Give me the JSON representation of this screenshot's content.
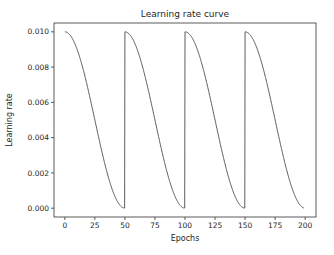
{
  "chart_data": {
    "type": "line",
    "title": "Learning rate curve",
    "xlabel": "Epochs",
    "ylabel": "Learning rate",
    "xlim": [
      -9,
      209
    ],
    "ylim": [
      -0.0005,
      0.0105
    ],
    "grid": false,
    "legend": null,
    "x_ticks": [
      0,
      25,
      50,
      75,
      100,
      125,
      150,
      175,
      200
    ],
    "x_tick_labels": [
      "0",
      "25",
      "50",
      "75",
      "100",
      "125",
      "150",
      "175",
      "200"
    ],
    "y_ticks": [
      0.0,
      0.002,
      0.004,
      0.006,
      0.008,
      0.01
    ],
    "y_tick_labels": [
      "0.000",
      "0.002",
      "0.004",
      "0.006",
      "0.008",
      "0.010"
    ],
    "series": [
      {
        "name": "learning rate",
        "color": "#333333",
        "schedule": "cosine annealing with warm restarts",
        "max_lr": 0.01,
        "min_lr": 0.0,
        "period_epochs": 50,
        "epoch_range": [
          0,
          199
        ],
        "x": [
          0,
          5,
          10,
          15,
          20,
          25,
          30,
          35,
          40,
          45,
          49,
          50,
          55,
          60,
          65,
          70,
          75,
          80,
          85,
          90,
          95,
          99,
          100,
          105,
          110,
          115,
          120,
          125,
          130,
          135,
          140,
          145,
          149,
          150,
          155,
          160,
          165,
          170,
          175,
          180,
          185,
          190,
          195,
          199
        ],
        "values": [
          0.01,
          0.00976,
          0.00905,
          0.00794,
          0.00655,
          0.005,
          0.00345,
          0.00206,
          0.00095,
          0.00024,
          1e-05,
          0.01,
          0.00976,
          0.00905,
          0.00794,
          0.00655,
          0.005,
          0.00345,
          0.00206,
          0.00095,
          0.00024,
          1e-05,
          0.01,
          0.00976,
          0.00905,
          0.00794,
          0.00655,
          0.005,
          0.00345,
          0.00206,
          0.00095,
          0.00024,
          1e-05,
          0.01,
          0.00976,
          0.00905,
          0.00794,
          0.00655,
          0.005,
          0.00345,
          0.00206,
          0.00095,
          0.00024,
          1e-05
        ]
      }
    ]
  }
}
